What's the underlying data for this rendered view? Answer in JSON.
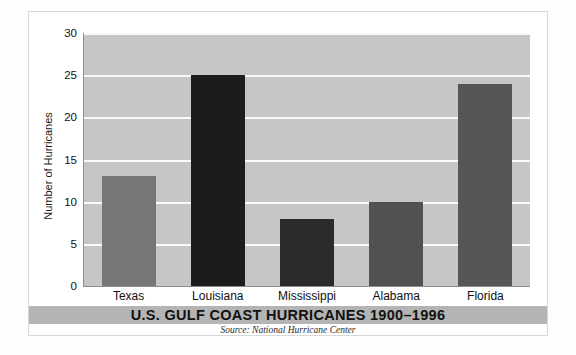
{
  "chart_data": {
    "type": "bar",
    "title": "U.S. GULF COAST HURRICANES 1900–1996",
    "source": "Source: National Hurricane Center",
    "xlabel": "",
    "ylabel": "Number of Hurricanes",
    "categories": [
      "Texas",
      "Louisiana",
      "Mississippi",
      "Alabama",
      "Florida"
    ],
    "values": [
      13,
      25,
      8,
      10,
      24
    ],
    "bar_colors": [
      "#767676",
      "#1c1c1c",
      "#2b2b2b",
      "#515151",
      "#565656"
    ],
    "ylim": [
      0,
      30
    ],
    "yticks": [
      0,
      5,
      10,
      15,
      20,
      25,
      30
    ],
    "ytick_labels": [
      "0",
      "5",
      "10",
      "15",
      "20",
      "25",
      "30"
    ],
    "grid": true,
    "gridline_color": "#fafafa",
    "plot_background": "#c6c6c6",
    "legend": "none",
    "legend_position": "none",
    "annotations": []
  },
  "colors": {
    "title_band": "#b4b4b4",
    "axis": "#8e8e8e",
    "frame_border": "#d8d8d8",
    "page_background": "#ffffff",
    "text": "#111111"
  }
}
